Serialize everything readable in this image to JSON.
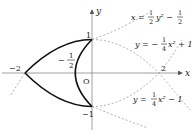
{
  "diagram": {
    "type": "coordinate-graph",
    "axes": {
      "x_label": "x",
      "y_label": "y",
      "origin_label": "O"
    },
    "tick_labels": {
      "neg_two": "−2",
      "two": "2",
      "one": "1",
      "neg_one": "−1",
      "neg_half_num": "1",
      "neg_half_den": "2",
      "neg_half_sign": "−"
    },
    "curves": [
      {
        "id": "curve1",
        "equation_lhs": "x",
        "equation_parts": [
          "x = ",
          "1",
          "2",
          "y² − ",
          "1",
          "2"
        ],
        "description": "x = (1/2)y^2 - 1/2"
      },
      {
        "id": "curve2",
        "equation_parts": [
          "y = −",
          "1",
          "4",
          "x² + 1"
        ],
        "description": "y = -(1/4)x^2 + 1"
      },
      {
        "id": "curve3",
        "equation_parts": [
          "y = ",
          "1",
          "4",
          "x² − 1"
        ],
        "description": "y = (1/4)x^2 - 1"
      }
    ],
    "colors": {
      "solid_curve": "#111111",
      "dashed_curve": "#999999",
      "axis": "#777777",
      "text": "#222222"
    }
  }
}
